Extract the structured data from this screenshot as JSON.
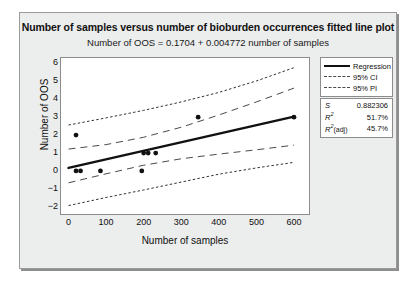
{
  "chart_data": {
    "type": "scatter",
    "title": "Number of samples versus number of bioburden occurrences fitted line plot",
    "subtitle": "Number of OOS = 0.1704 + 0.004772 number of samples",
    "xlabel": "Number of samples",
    "ylabel": "Number of OOS",
    "xlim": [
      -20,
      640
    ],
    "ylim": [
      -2.4,
      6.3
    ],
    "xticks": [
      0,
      100,
      200,
      300,
      400,
      500,
      600
    ],
    "yticks": [
      6,
      5,
      4,
      3,
      2,
      1,
      0,
      "−1",
      "−2"
    ],
    "grid": false,
    "legend_position": "right",
    "points": [
      {
        "x": 20,
        "y": 2
      },
      {
        "x": 20,
        "y": 0
      },
      {
        "x": 32,
        "y": 0
      },
      {
        "x": 85,
        "y": 0
      },
      {
        "x": 195,
        "y": 0
      },
      {
        "x": 200,
        "y": 1
      },
      {
        "x": 212,
        "y": 1
      },
      {
        "x": 232,
        "y": 1
      },
      {
        "x": 345,
        "y": 3
      },
      {
        "x": 600,
        "y": 3
      }
    ],
    "fit": {
      "intercept": 0.1704,
      "slope": 0.004772
    },
    "series": [
      {
        "name": "Regression",
        "style": "solid"
      },
      {
        "name": "95% CI",
        "style": "long-dash"
      },
      {
        "name": "95% PI",
        "style": "short-dash"
      }
    ],
    "ci_upper": [
      [
        0,
        1.22
      ],
      [
        100,
        1.47
      ],
      [
        200,
        1.88
      ],
      [
        300,
        2.44
      ],
      [
        400,
        3.12
      ],
      [
        500,
        3.85
      ],
      [
        600,
        4.62
      ]
    ],
    "ci_lower": [
      [
        0,
        -0.66
      ],
      [
        100,
        -0.16
      ],
      [
        200,
        0.32
      ],
      [
        300,
        0.68
      ],
      [
        400,
        0.94
      ],
      [
        500,
        1.18
      ],
      [
        600,
        1.44
      ]
    ],
    "pi_upper": [
      [
        0,
        2.56
      ],
      [
        100,
        2.96
      ],
      [
        200,
        3.38
      ],
      [
        300,
        3.85
      ],
      [
        400,
        4.38
      ],
      [
        500,
        5.02
      ],
      [
        600,
        5.76
      ]
    ],
    "pi_lower": [
      [
        0,
        -1.93
      ],
      [
        100,
        -1.48
      ],
      [
        200,
        -1.06
      ],
      [
        300,
        -0.62
      ],
      [
        400,
        -0.18
      ],
      [
        500,
        0.17
      ],
      [
        600,
        0.48
      ]
    ]
  },
  "legend": {
    "items": [
      {
        "label": "Regression",
        "style": "solid"
      },
      {
        "label": "95% CI",
        "style": "dash"
      },
      {
        "label": "95% PI",
        "style": "dot"
      }
    ]
  },
  "stats": {
    "rows": [
      {
        "key": "S",
        "sup": "",
        "adj": "",
        "value": "0.882306"
      },
      {
        "key": "R",
        "sup": "2",
        "adj": "",
        "value": "51.7%"
      },
      {
        "key": "R",
        "sup": "2",
        "adj": "(adj)",
        "value": "45.7%"
      }
    ]
  }
}
